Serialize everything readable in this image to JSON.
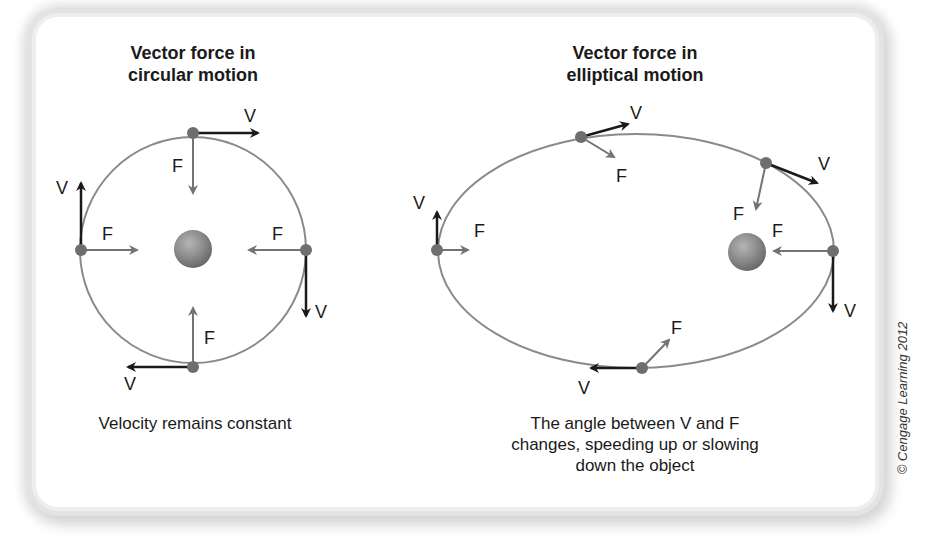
{
  "figure": {
    "left_panel": {
      "title_line1": "Vector force in",
      "title_line2": "circular motion",
      "caption": "Velocity remains constant",
      "labels": {
        "top_v": "V",
        "top_f": "F",
        "left_v": "V",
        "left_f": "F",
        "right_v": "V",
        "right_f": "F",
        "bottom_v": "V",
        "bottom_f": "F"
      }
    },
    "right_panel": {
      "title_line1": "Vector force in",
      "title_line2": "elliptical motion",
      "caption_line1": "The angle between V and F",
      "caption_line2": "changes, speeding up or slowing",
      "caption_line3": "down the object",
      "labels": {
        "top_v": "V",
        "top_f": "F",
        "upper_right_v": "V",
        "upper_right_f": "F",
        "left_v": "V",
        "left_f": "F",
        "right_v": "V",
        "right_f": "F",
        "bottom_v": "V",
        "bottom_f": "F"
      }
    },
    "credit": "© Cengage Learning 2012",
    "colors": {
      "orbit": "#8a8a8a",
      "planet_dot": "#6e6e6e",
      "velocity_arrow": "#1a1a1a",
      "force_arrow": "#737373",
      "central_body": "#8c8c8c"
    }
  }
}
